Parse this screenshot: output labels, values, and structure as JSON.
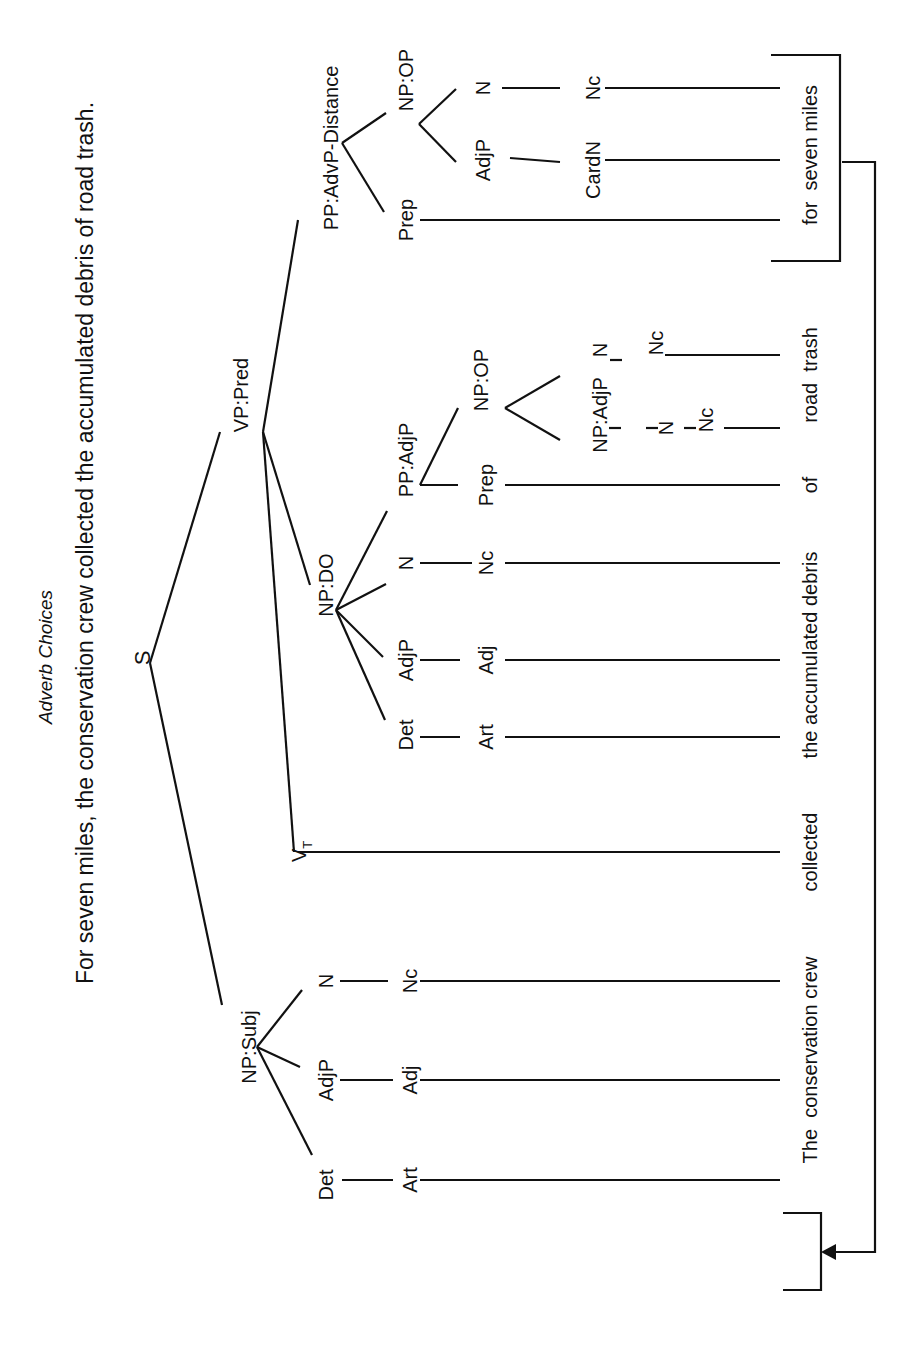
{
  "title": "Adverb Choices",
  "sentence": "For seven miles, the conservation crew collected the accumulated debris of road trash.",
  "tree": {
    "root": "S",
    "vp": "VP:Pred",
    "np_subj": "NP:Subj",
    "pp_adv": "PP:AdvP-Distance",
    "np_do": "NP:DO",
    "vt": "V",
    "vt_sub": "T",
    "subj": {
      "det": "Det",
      "adjp": "AdjP",
      "n": "N",
      "art": "Art",
      "adj": "Adj",
      "nc": "Nc"
    },
    "do": {
      "det": "Det",
      "adjp": "AdjP",
      "n": "N",
      "pp": "PP:AdjP",
      "art": "Art",
      "adj": "Adj",
      "nc": "Nc",
      "prep": "Prep",
      "npop": "NP:OP",
      "npadjp": "NP:AdjP",
      "n2": "N",
      "nc2": "Nc",
      "n3": "N",
      "nc3": "Nc"
    },
    "adv": {
      "prep": "Prep",
      "npop": "NP:OP",
      "adjp": "AdjP",
      "n": "N",
      "cardn": "CardN",
      "nc": "Nc"
    }
  },
  "words": {
    "subject": "The  conservation crew",
    "verb": "collected",
    "object": "the accumulated debris",
    "of": "of",
    "road_trash": "road  trash",
    "adverbial": "for  seven miles"
  }
}
